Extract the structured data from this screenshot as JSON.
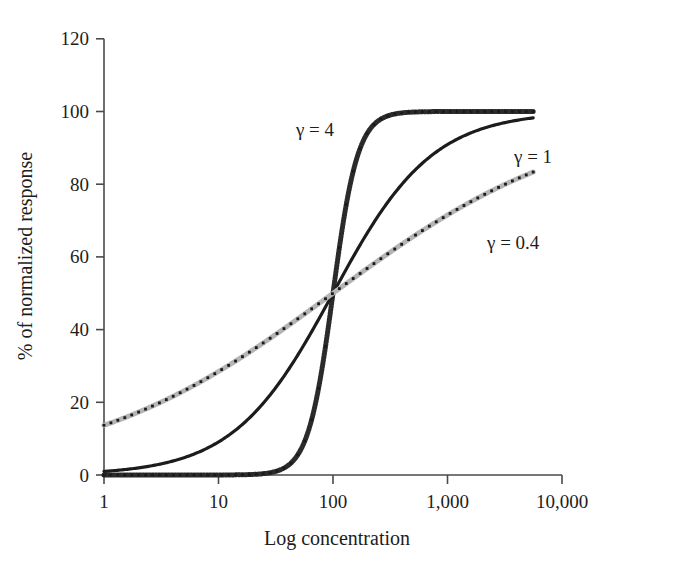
{
  "chart_data": {
    "type": "line",
    "title": "",
    "subtitle": "",
    "xlabel": "Log concentration",
    "ylabel": "% of normalized response",
    "x_scale": "log",
    "xlim": [
      1,
      10000
    ],
    "ylim": [
      0,
      120
    ],
    "x_ticks": [
      1,
      10,
      100,
      1000,
      10000
    ],
    "x_tick_labels": [
      "1",
      "10",
      "100",
      "1,000",
      "10,000"
    ],
    "y_ticks": [
      0,
      20,
      40,
      60,
      80,
      100,
      120
    ],
    "y_tick_labels": [
      "0",
      "20",
      "40",
      "60",
      "80",
      "100",
      "120"
    ],
    "grid": false,
    "legend_position": "inline-annotations",
    "x": [
      1,
      1.5,
      2,
      3,
      4,
      5,
      7,
      10,
      15,
      20,
      30,
      40,
      50,
      70,
      100,
      150,
      200,
      300,
      400,
      500,
      700,
      1000,
      1500,
      2000,
      3000,
      4000,
      5000,
      5600
    ],
    "series": [
      {
        "name": "γ = 4",
        "label": "γ = 4",
        "gamma": 4,
        "color": "#2b2b2b",
        "style": "dotted-thick",
        "values": [
          0.0,
          0.0,
          0.0,
          0.0,
          0.0,
          0.1,
          0.2,
          0.8,
          4.8,
          13.8,
          44.8,
          71.9,
          86.2,
          96.0,
          99.0,
          99.8,
          99.9,
          100.0,
          100.0,
          100.0,
          100.0,
          100.0,
          100.0,
          100.0,
          100.0,
          100.0,
          100.0,
          100.0
        ]
      },
      {
        "name": "γ = 1",
        "label": "γ = 1",
        "gamma": 1,
        "color": "#1c1c1c",
        "style": "solid",
        "values": [
          1.0,
          1.5,
          2.0,
          2.9,
          3.8,
          4.8,
          6.5,
          9.1,
          13.0,
          16.7,
          23.1,
          28.6,
          33.3,
          41.2,
          50.0,
          60.0,
          66.7,
          75.0,
          80.0,
          83.3,
          87.5,
          90.9,
          93.8,
          95.2,
          96.8,
          97.6,
          98.0,
          98.2
        ]
      },
      {
        "name": "γ = 0.4",
        "label": "γ = 0.4",
        "gamma": 0.4,
        "color": "#b5b5b5",
        "style": "dotted-thick",
        "values": [
          13.7,
          17.8,
          20.5,
          24.4,
          27.1,
          29.3,
          32.6,
          35.9,
          40.0,
          42.8,
          46.8,
          49.6,
          51.7,
          55.0,
          58.6,
          62.5,
          65.1,
          68.8,
          71.4,
          73.3,
          76.1,
          78.6,
          81.3,
          83.0,
          85.4,
          86.9,
          88.0,
          88.5
        ]
      }
    ],
    "annotations": [
      {
        "text": "γ = 4",
        "x_px": 334,
        "y_px": 136,
        "anchor": "end"
      },
      {
        "text": "γ = 1",
        "x_px": 514,
        "y_px": 163,
        "anchor": "start"
      },
      {
        "text": "γ = 0.4",
        "x_px": 487,
        "y_px": 249,
        "anchor": "start"
      }
    ],
    "ec50": 100,
    "model": "Hill equation: response = 100 * c^γ / (c^γ + EC50^γ)",
    "curves_end_x": 5600,
    "colors": {
      "axis": "#4a4a4a",
      "text": "#1d1d1d",
      "gamma4": "#2b2b2b",
      "gamma1": "#1c1c1c",
      "gamma04": "#b5b5b5",
      "background": "#ffffff"
    }
  }
}
